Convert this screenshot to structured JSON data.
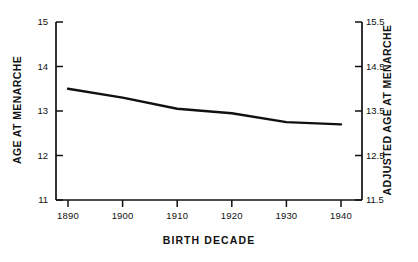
{
  "chart_data": {
    "type": "line",
    "title": "",
    "xlabel": "BIRTH DECADE",
    "ylabel": "AGE AT MENARCHE",
    "y2label": "ADJUSTED AGE AT MENARCHE",
    "categories": [
      "1890",
      "1900",
      "1910",
      "1920",
      "1930",
      "1940"
    ],
    "x": [
      1890,
      1900,
      1910,
      1920,
      1930,
      1940
    ],
    "values": [
      13.5,
      13.3,
      13.05,
      12.95,
      12.75,
      12.7
    ],
    "series": [
      {
        "name": "Age at menarche",
        "values": [
          13.5,
          13.3,
          13.05,
          12.95,
          12.75,
          12.7
        ]
      }
    ],
    "xlim": [
      1890,
      1940
    ],
    "ylim": [
      11,
      15
    ],
    "y2lim": [
      11.5,
      15.5
    ],
    "yticks": [
      "11",
      "12",
      "13",
      "14",
      "15"
    ],
    "ytick_values": [
      11,
      12,
      13,
      14,
      15
    ],
    "y2ticks": [
      "11.5",
      "12.5",
      "13.5",
      "14.5",
      "15.5"
    ],
    "y2tick_values": [
      11.5,
      12.5,
      13.5,
      14.5,
      15.5
    ],
    "xticks": [
      "1890",
      "1900",
      "1910",
      "1920",
      "1930",
      "1940"
    ],
    "grid": false,
    "legend": false,
    "line_color": "#111111"
  },
  "axes": {
    "left_title": "AGE AT MENARCHE",
    "right_title": "ADJUSTED AGE AT MENARCHE",
    "bottom_title": "BIRTH DECADE"
  },
  "ticks": {
    "left": [
      "15",
      "14",
      "13",
      "12",
      "11"
    ],
    "right": [
      "15.5",
      "14.5",
      "13.5",
      "12.5",
      "11.5"
    ],
    "bottom": [
      "1890",
      "1900",
      "1910",
      "1920",
      "1930",
      "1940"
    ]
  }
}
